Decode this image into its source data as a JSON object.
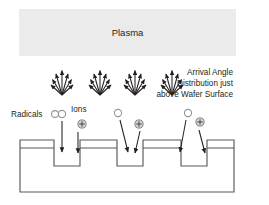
{
  "figure": {
    "kind": "process-schematic",
    "title_region": {
      "plasma_label": "Plasma"
    },
    "labels": {
      "radicals": "Radicals",
      "ions": "Ions",
      "annotation_line_1": "Arrival Angle",
      "annotation_line_2": "Distribution just",
      "annotation_line_3": "above Wafer Surface"
    },
    "colors": {
      "plasma_fill": "#ebebeb",
      "wafer_stroke": "#58595b",
      "wafer_fill": "#ffffff",
      "arrow_stroke": "#231f20",
      "particle_fill": "#d9d9d9",
      "particle_stroke": "#808285",
      "text": "#231f20",
      "background": "#ffffff"
    },
    "plasma_region": {
      "x": 19,
      "y": 9,
      "width": 217,
      "height": 47
    },
    "arrival_fans": [
      {
        "id": "fan-1",
        "cx": 62,
        "cy": 95,
        "count": 7
      },
      {
        "id": "fan-2",
        "cx": 100,
        "cy": 95,
        "count": 7
      },
      {
        "id": "fan-3",
        "cx": 135,
        "cy": 95,
        "count": 7
      },
      {
        "id": "fan-4",
        "cx": 172,
        "cy": 95,
        "count": 7
      }
    ],
    "wafer": {
      "left": 20,
      "right": 234,
      "surface_y": 140,
      "base_y": 192,
      "film_y": 148,
      "trench_bottom": 166,
      "trenches": [
        {
          "id": "trench-1",
          "x1": 54,
          "x2": 80
        },
        {
          "id": "trench-2",
          "x1": 117,
          "x2": 143
        },
        {
          "id": "trench-3",
          "x1": 181,
          "x2": 207
        }
      ]
    },
    "particles": [
      {
        "id": "radical-1",
        "type": "radical",
        "cx": 62,
        "cy": 114
      },
      {
        "id": "ion-1",
        "type": "ion",
        "cx": 82,
        "cy": 124
      },
      {
        "id": "radical-2",
        "type": "radical",
        "cx": 118,
        "cy": 113
      },
      {
        "id": "ion-2",
        "type": "ion",
        "cx": 139,
        "cy": 124
      },
      {
        "id": "radical-3",
        "type": "radical",
        "cx": 188,
        "cy": 113
      },
      {
        "id": "ion-3",
        "type": "ion",
        "cx": 200,
        "cy": 122
      }
    ],
    "trajectories": [
      {
        "id": "traj-radical-1",
        "x1": 62,
        "y1": 121,
        "x2": 62,
        "y2": 152
      },
      {
        "id": "traj-ion-1",
        "x1": 78,
        "y1": 132,
        "x2": 78,
        "y2": 153
      },
      {
        "id": "traj-radical-2",
        "x1": 120,
        "y1": 120,
        "x2": 128,
        "y2": 152
      },
      {
        "id": "traj-ion-2",
        "x1": 140,
        "y1": 131,
        "x2": 135,
        "y2": 153
      },
      {
        "id": "traj-radical-3",
        "x1": 186,
        "y1": 120,
        "x2": 180,
        "y2": 152
      },
      {
        "id": "traj-ion-3",
        "x1": 199,
        "y1": 130,
        "x2": 205,
        "y2": 153
      }
    ]
  }
}
